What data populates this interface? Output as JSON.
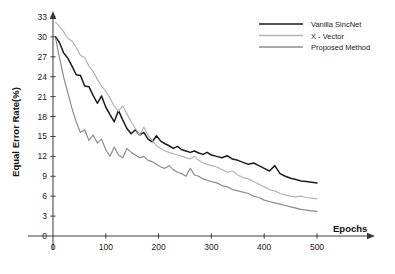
{
  "chart_data": {
    "type": "line",
    "title": "",
    "xlabel": "Epochs",
    "ylabel": "Equal Error Rate(%)",
    "xlim": [
      0,
      540
    ],
    "ylim": [
      0,
      33
    ],
    "xticks": [
      0,
      100,
      200,
      300,
      400,
      500
    ],
    "yticks": [
      0,
      3,
      6,
      9,
      12,
      15,
      18,
      21,
      24,
      27,
      30,
      33
    ],
    "grid": false,
    "legend_position": "top-right",
    "colors": {
      "vanilla_sincnet": "#1c1c1c",
      "x_vector": "#b4b4b4",
      "proposed_method": "#8c8c8c",
      "axis": "#3a3a3a",
      "background": "#ffffff"
    },
    "series": [
      {
        "name": "Vanilla SincNet",
        "color": "#1c1c1c",
        "x": [
          5,
          12,
          20,
          28,
          36,
          44,
          52,
          60,
          68,
          76,
          84,
          92,
          100,
          108,
          116,
          124,
          132,
          140,
          148,
          156,
          164,
          172,
          180,
          188,
          196,
          204,
          212,
          220,
          228,
          236,
          244,
          252,
          260,
          268,
          276,
          284,
          292,
          300,
          310,
          320,
          330,
          340,
          350,
          360,
          370,
          380,
          390,
          400,
          410,
          420,
          430,
          440,
          450,
          460,
          470,
          480,
          490,
          500
        ],
        "y": [
          30.0,
          29.2,
          27.6,
          26.8,
          25.6,
          24.3,
          24.2,
          22.6,
          22.5,
          21.2,
          20.0,
          21.1,
          19.4,
          18.3,
          17.2,
          18.9,
          17.5,
          16.2,
          15.4,
          16.0,
          15.2,
          15.6,
          14.6,
          14.2,
          15.1,
          14.3,
          13.9,
          13.6,
          13.2,
          13.5,
          13.0,
          12.8,
          12.6,
          12.8,
          12.5,
          12.3,
          12.6,
          12.2,
          12.0,
          11.8,
          12.1,
          11.6,
          11.4,
          11.1,
          10.8,
          11.0,
          10.6,
          10.2,
          9.8,
          10.6,
          9.4,
          9.0,
          8.7,
          8.5,
          8.3,
          8.2,
          8.1,
          8.0
        ]
      },
      {
        "name": "X - Vector",
        "color": "#b4b4b4",
        "x": [
          5,
          12,
          20,
          28,
          36,
          44,
          52,
          60,
          68,
          76,
          84,
          92,
          100,
          108,
          116,
          124,
          132,
          140,
          148,
          156,
          164,
          172,
          180,
          188,
          196,
          204,
          212,
          220,
          228,
          236,
          244,
          252,
          260,
          268,
          276,
          284,
          292,
          300,
          310,
          320,
          330,
          340,
          350,
          360,
          370,
          380,
          390,
          400,
          410,
          420,
          430,
          440,
          450,
          460,
          470,
          480,
          490,
          500
        ],
        "y": [
          32.2,
          31.6,
          30.8,
          29.8,
          29.4,
          28.4,
          27.2,
          26.9,
          25.6,
          24.8,
          23.6,
          22.6,
          21.8,
          20.8,
          19.6,
          18.8,
          19.6,
          18.4,
          17.2,
          16.2,
          15.2,
          16.4,
          15.2,
          14.4,
          13.6,
          13.2,
          12.8,
          12.6,
          12.4,
          12.2,
          12.0,
          11.8,
          11.6,
          12.0,
          11.4,
          11.0,
          10.8,
          10.6,
          10.4,
          10.0,
          9.6,
          9.8,
          9.2,
          8.8,
          8.6,
          8.2,
          7.8,
          7.4,
          7.0,
          6.8,
          6.4,
          6.2,
          6.0,
          5.9,
          6.0,
          5.8,
          5.7,
          5.6
        ]
      },
      {
        "name": "Proposed Method",
        "color": "#8c8c8c",
        "x": [
          5,
          12,
          20,
          28,
          36,
          44,
          52,
          60,
          68,
          76,
          84,
          92,
          100,
          108,
          116,
          124,
          132,
          140,
          148,
          156,
          164,
          172,
          180,
          188,
          196,
          204,
          212,
          220,
          228,
          236,
          244,
          252,
          260,
          268,
          276,
          284,
          292,
          300,
          310,
          320,
          330,
          340,
          350,
          360,
          370,
          380,
          390,
          400,
          410,
          420,
          430,
          440,
          450,
          460,
          470,
          480,
          490,
          500
        ],
        "y": [
          29.8,
          27.0,
          24.0,
          21.6,
          19.2,
          17.2,
          15.6,
          16.0,
          14.4,
          15.2,
          14.0,
          14.6,
          13.0,
          12.0,
          13.4,
          12.2,
          11.8,
          13.2,
          12.6,
          12.2,
          11.8,
          12.0,
          11.4,
          11.2,
          10.8,
          10.4,
          10.2,
          10.6,
          10.0,
          9.6,
          9.4,
          9.0,
          10.2,
          9.2,
          9.0,
          8.6,
          8.4,
          8.2,
          8.0,
          7.6,
          7.4,
          7.0,
          6.8,
          6.6,
          6.4,
          6.0,
          5.8,
          5.4,
          5.2,
          5.0,
          4.8,
          4.6,
          4.4,
          4.2,
          4.0,
          3.9,
          3.8,
          3.7
        ]
      }
    ]
  },
  "legend": {
    "items": [
      {
        "label": "Vanilla SincNet"
      },
      {
        "label": "X - Vector"
      },
      {
        "label": "Proposed Method"
      }
    ]
  },
  "axes": {
    "x_title": "Epochs",
    "y_title": "Equal Error Rate(%)"
  }
}
